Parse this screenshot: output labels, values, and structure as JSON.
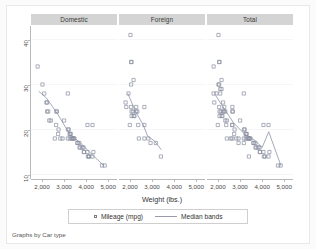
{
  "chart_data": {
    "type": "scatter",
    "title": "",
    "xlabel": "Weight (lbs.)",
    "ylabel": "",
    "caption": "Graphs by Car type",
    "xlim": [
      1500,
      5400
    ],
    "ylim": [
      9,
      43
    ],
    "xticks": [
      2000,
      3000,
      4000,
      5000
    ],
    "xticklabels": [
      "2,000",
      "3,000",
      "4,000",
      "5,000"
    ],
    "yticks": [
      10,
      20,
      30,
      40
    ],
    "yticklabels": [
      "10",
      "20",
      "30",
      "40"
    ],
    "grid": "horizontal",
    "legend_position": "bottom",
    "legend": [
      {
        "label": "Mileage (mpg)",
        "marker": "open-square"
      },
      {
        "label": "Median bands",
        "marker": "line"
      }
    ],
    "panels": [
      {
        "title": "Domestic",
        "points": [
          [
            1800,
            34
          ],
          [
            2020,
            30
          ],
          [
            2100,
            28
          ],
          [
            2230,
            26
          ],
          [
            2230,
            24
          ],
          [
            2280,
            24
          ],
          [
            2330,
            22
          ],
          [
            2400,
            22
          ],
          [
            2650,
            24
          ],
          [
            2670,
            24
          ],
          [
            2640,
            21
          ],
          [
            2750,
            20
          ],
          [
            2730,
            19
          ],
          [
            2830,
            18
          ],
          [
            3000,
            22
          ],
          [
            3170,
            28
          ],
          [
            3180,
            20
          ],
          [
            3210,
            20
          ],
          [
            3250,
            19
          ],
          [
            3280,
            19
          ],
          [
            3300,
            19
          ],
          [
            3350,
            18
          ],
          [
            3370,
            18
          ],
          [
            3420,
            18
          ],
          [
            3430,
            18
          ],
          [
            3470,
            18
          ],
          [
            3600,
            17
          ],
          [
            3620,
            17
          ],
          [
            3690,
            17
          ],
          [
            3700,
            16
          ],
          [
            3740,
            16
          ],
          [
            3830,
            16
          ],
          [
            3880,
            16
          ],
          [
            3900,
            15
          ],
          [
            3900,
            15
          ],
          [
            4060,
            15
          ],
          [
            4080,
            14
          ],
          [
            4130,
            14
          ],
          [
            4130,
            14
          ],
          [
            4290,
            14
          ],
          [
            4330,
            15
          ],
          [
            4060,
            21
          ],
          [
            4290,
            21
          ],
          [
            4720,
            12
          ],
          [
            4840,
            12
          ],
          [
            2930,
            18
          ],
          [
            3170,
            18
          ],
          [
            2200,
            26
          ],
          [
            2580,
            18
          ],
          [
            3260,
            18
          ]
        ],
        "median_band": [
          [
            1850,
            28.5
          ],
          [
            2200,
            27.0
          ],
          [
            2700,
            23.5
          ],
          [
            3250,
            19.0
          ],
          [
            3750,
            17.0
          ],
          [
            4250,
            14.5
          ],
          [
            4800,
            12.0
          ]
        ]
      },
      {
        "title": "Foreign",
        "points": [
          [
            2020,
            41
          ],
          [
            2050,
            35
          ],
          [
            2070,
            35
          ],
          [
            2160,
            31
          ],
          [
            2050,
            30
          ],
          [
            1930,
            28
          ],
          [
            1800,
            26
          ],
          [
            1830,
            25
          ],
          [
            2050,
            25
          ],
          [
            2280,
            25
          ],
          [
            2650,
            25
          ],
          [
            2070,
            24
          ],
          [
            2130,
            24
          ],
          [
            2280,
            24
          ],
          [
            2330,
            24
          ],
          [
            2160,
            23
          ],
          [
            1990,
            21
          ],
          [
            2370,
            21
          ],
          [
            2650,
            21
          ],
          [
            2400,
            18
          ],
          [
            2650,
            18
          ],
          [
            2830,
            18
          ],
          [
            2930,
            17
          ],
          [
            3170,
            17
          ],
          [
            3400,
            14
          ],
          [
            2070,
            23
          ],
          [
            2200,
            23
          ]
        ],
        "median_band": [
          [
            1900,
            28.0
          ],
          [
            2250,
            24.0
          ],
          [
            2600,
            21.0
          ],
          [
            2800,
            18.5
          ],
          [
            3100,
            17.5
          ],
          [
            3420,
            15.5
          ]
        ]
      },
      {
        "title": "Total",
        "points": [
          [
            2020,
            41
          ],
          [
            2050,
            35
          ],
          [
            2070,
            35
          ],
          [
            1800,
            34
          ],
          [
            2160,
            31
          ],
          [
            2050,
            30
          ],
          [
            2020,
            30
          ],
          [
            2160,
            29
          ],
          [
            2100,
            29
          ],
          [
            1800,
            28
          ],
          [
            1930,
            28
          ],
          [
            2100,
            28
          ],
          [
            3170,
            28
          ],
          [
            1830,
            26
          ],
          [
            2230,
            26
          ],
          [
            2050,
            25
          ],
          [
            2280,
            25
          ],
          [
            2650,
            25
          ],
          [
            2070,
            24
          ],
          [
            2130,
            24
          ],
          [
            2230,
            24
          ],
          [
            2280,
            24
          ],
          [
            2330,
            24
          ],
          [
            2650,
            24
          ],
          [
            2670,
            24
          ],
          [
            2160,
            23
          ],
          [
            2070,
            23
          ],
          [
            2200,
            23
          ],
          [
            2330,
            22
          ],
          [
            2400,
            22
          ],
          [
            3000,
            22
          ],
          [
            1990,
            21
          ],
          [
            2370,
            21
          ],
          [
            2640,
            21
          ],
          [
            2650,
            21
          ],
          [
            4060,
            21
          ],
          [
            4290,
            21
          ],
          [
            2750,
            20
          ],
          [
            3180,
            20
          ],
          [
            3210,
            20
          ],
          [
            2730,
            19
          ],
          [
            3250,
            19
          ],
          [
            3280,
            19
          ],
          [
            3300,
            19
          ],
          [
            2400,
            18
          ],
          [
            2650,
            18
          ],
          [
            2830,
            18
          ],
          [
            2930,
            18
          ],
          [
            3170,
            18
          ],
          [
            3350,
            18
          ],
          [
            3370,
            18
          ],
          [
            3420,
            18
          ],
          [
            3430,
            18
          ],
          [
            3470,
            18
          ],
          [
            2930,
            17
          ],
          [
            3170,
            17
          ],
          [
            3600,
            17
          ],
          [
            3620,
            17
          ],
          [
            3690,
            17
          ],
          [
            3700,
            16
          ],
          [
            3740,
            16
          ],
          [
            3830,
            16
          ],
          [
            3880,
            16
          ],
          [
            3900,
            15
          ],
          [
            4060,
            15
          ],
          [
            4330,
            15
          ],
          [
            3400,
            14
          ],
          [
            4080,
            14
          ],
          [
            4130,
            14
          ],
          [
            4290,
            14
          ],
          [
            4720,
            12
          ],
          [
            4840,
            12
          ],
          [
            2580,
            18
          ],
          [
            3260,
            18
          ],
          [
            3900,
            15
          ]
        ],
        "median_band": [
          [
            1900,
            27.5
          ],
          [
            2300,
            24.5
          ],
          [
            2700,
            21.5
          ],
          [
            3200,
            19.0
          ],
          [
            3700,
            17.5
          ],
          [
            4000,
            16.0
          ],
          [
            4300,
            19.5
          ],
          [
            4850,
            12.0
          ]
        ]
      }
    ]
  }
}
